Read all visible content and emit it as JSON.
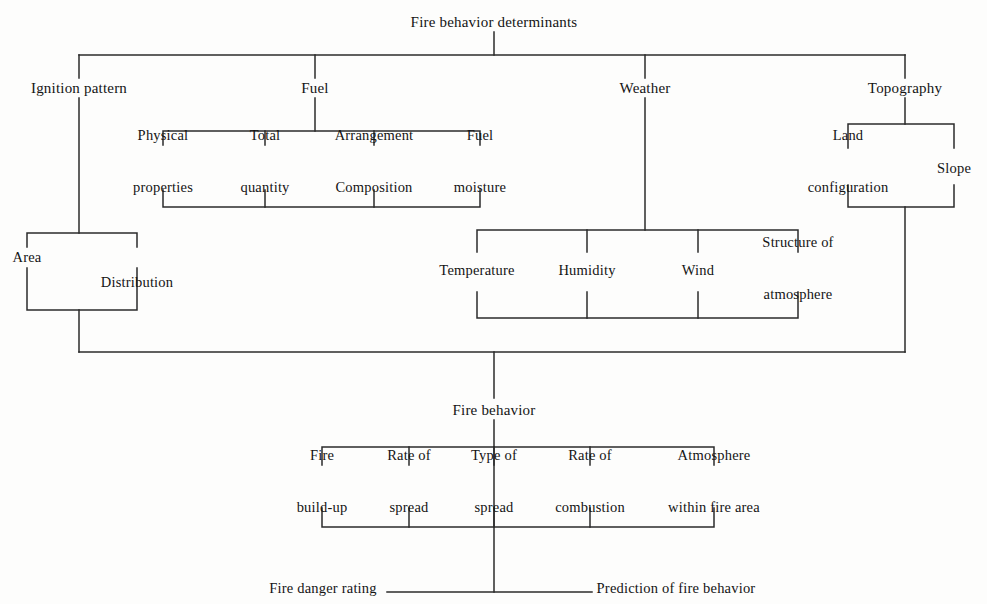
{
  "diagram": {
    "title": "Fire behavior determinants",
    "root": {
      "label": "Fire behavior determinants",
      "x": 494,
      "y": 22
    },
    "level1": [
      {
        "label": "Ignition pattern",
        "x": 79,
        "y": 88
      },
      {
        "label": "Fuel",
        "x": 315,
        "y": 88
      },
      {
        "label": "Weather",
        "x": 645,
        "y": 88
      },
      {
        "label": "Topography",
        "x": 905,
        "y": 88
      }
    ],
    "ignition_children": [
      {
        "label": "Area",
        "x": 27,
        "y": 257
      },
      {
        "label": "Distribution",
        "x": 137,
        "y": 282
      }
    ],
    "fuel_children": [
      {
        "line1": "Physical",
        "line2": "properties",
        "x": 163,
        "y": 161
      },
      {
        "line1": "Total",
        "line2": "quantity",
        "x": 265,
        "y": 161
      },
      {
        "line1": "Arrangement",
        "line2": "Composition",
        "x": 374,
        "y": 161
      },
      {
        "line1": "Fuel",
        "line2": "moisture",
        "x": 480,
        "y": 161
      }
    ],
    "weather_children": [
      {
        "line1": "Temperature",
        "line2": "",
        "x": 477,
        "y": 270
      },
      {
        "line1": "Humidity",
        "line2": "",
        "x": 587,
        "y": 270
      },
      {
        "line1": "Wind",
        "line2": "",
        "x": 698,
        "y": 270
      },
      {
        "line1": "Structure of",
        "line2": "atmosphere",
        "x": 798,
        "y": 268
      }
    ],
    "topography_children": [
      {
        "line1": "Land",
        "line2": "configuration",
        "x": 848,
        "y": 161
      },
      {
        "line1": "Slope",
        "line2": "",
        "x": 954,
        "y": 168
      }
    ],
    "fire_behavior": {
      "label": "Fire behavior",
      "x": 494,
      "y": 410
    },
    "fire_behavior_children": [
      {
        "line1": "Fire",
        "line2": "build-up",
        "x": 322,
        "y": 481
      },
      {
        "line1": "Rate of",
        "line2": "spread",
        "x": 409,
        "y": 481
      },
      {
        "line1": "Type of",
        "line2": "spread",
        "x": 494,
        "y": 481
      },
      {
        "line1": "Rate of",
        "line2": "combustion",
        "x": 590,
        "y": 481
      },
      {
        "line1": "Atmosphere",
        "line2": "within fire area",
        "x": 714,
        "y": 481
      }
    ],
    "outcomes": [
      {
        "label": "Fire danger rating",
        "x": 323,
        "y": 588,
        "anchor": "center"
      },
      {
        "label": "Prediction of fire behavior",
        "x": 676,
        "y": 588,
        "anchor": "center"
      }
    ],
    "colors": {
      "line": "#2b2b2b",
      "text": "#141414",
      "background": "#fdfdfc"
    }
  }
}
